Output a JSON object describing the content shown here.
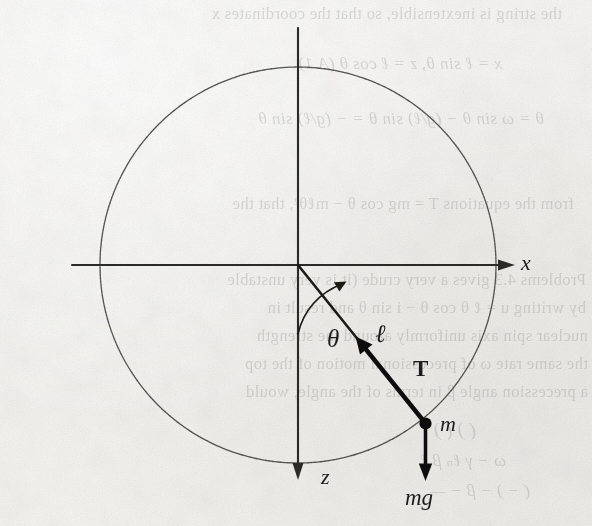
{
  "page": {
    "kind": "scanned-textbook-figure",
    "width": 592,
    "height": 526,
    "paper_color": "#f5f4f2",
    "ink_color": "#1d1d1d"
  },
  "figure": {
    "origin": {
      "x": 298,
      "y": 265
    },
    "circle": {
      "cx": 298,
      "cy": 265,
      "r": 198,
      "stroke": "#4a4a48"
    },
    "theta_deg": 39,
    "bob": {
      "x": 425,
      "y": 423,
      "radius": 5.5
    },
    "axes": [
      {
        "name": "x-axis",
        "label": "x",
        "dir": "right",
        "from_x": 72,
        "to_x": 497,
        "y": 265,
        "arrow_x": 503
      },
      {
        "name": "z-axis",
        "label": "z",
        "dir": "down",
        "x": 298,
        "from_y": 28,
        "to_y": 468,
        "arrow_y": 476
      }
    ],
    "labels": {
      "x_axis": "x",
      "z_axis": "z",
      "angle": "θ",
      "length": "ℓ",
      "tension": "T",
      "mass": "m",
      "weight": "mg"
    },
    "arrow_vectors": [
      {
        "name": "tension-vector",
        "label": "T",
        "from": "bob",
        "to": "origin",
        "style": "bold"
      },
      {
        "name": "weight-vector",
        "label": "mg",
        "from": "bob",
        "to": "below",
        "style": "bold"
      },
      {
        "name": "angle-arc-arrow",
        "label": "θ",
        "style": "thin-arc"
      }
    ]
  },
  "bleed_through": {
    "note": "Faint mirrored show-through of text printed on the reverse of the page.",
    "lines": [
      {
        "text": "the string is inextensible, so that the coordinates x",
        "x": 30,
        "y": 6,
        "size": 16.5,
        "italic": false
      },
      {
        "text": "x = ℓ sin θ,        z = ℓ cos θ           (A.1)",
        "x": 90,
        "y": 55,
        "size": 17,
        "italic": true
      },
      {
        "text": "θ = ω sin θ − (g/ℓ) sin θ = − (g/ℓ) sin θ",
        "x": 48,
        "y": 110,
        "size": 17,
        "italic": true
      },
      {
        "text": "from the equations T = mg cos θ − mℓθ², that the",
        "x": 18,
        "y": 196,
        "size": 16.5,
        "italic": false
      },
      {
        "text": "Problems 4.3 gives a very crude (it is very unstable",
        "x": 6,
        "y": 272,
        "size": 16.5,
        "italic": false
      },
      {
        "text": "by writing u = ℓ θ cos θ − i sin θ and result in",
        "x": 6,
        "y": 300,
        "size": 16.5,
        "italic": false
      },
      {
        "text": "nuclear spin axis uniformly around the strength",
        "x": 4,
        "y": 328,
        "size": 16.5,
        "italic": false
      },
      {
        "text": "the same rate ω of precessional motion of the top",
        "x": 4,
        "y": 356,
        "size": 16.5,
        "italic": false
      },
      {
        "text": "a precession angle β in terms of the angle, would",
        "x": 4,
        "y": 384,
        "size": 16.5,
        "italic": false
      },
      {
        "text": "(                    )                      (     )",
        "x": 116,
        "y": 420,
        "size": 19,
        "italic": true
      },
      {
        "text": "ω    − γ ℓₙ             β             ℓ",
        "x": 86,
        "y": 452,
        "size": 17,
        "italic": true
      },
      {
        "text": "(   −          )        −   β −          —",
        "x": 62,
        "y": 482,
        "size": 17,
        "italic": true
      }
    ]
  }
}
